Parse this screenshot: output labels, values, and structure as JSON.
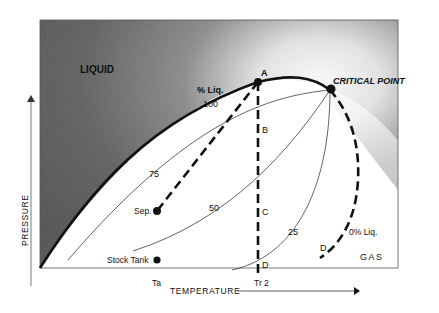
{
  "diagram": {
    "regions": {
      "liquid": "LIQUID",
      "gas": "GAS"
    },
    "critical_point": "CRITICAL POINT",
    "points": {
      "A": "A",
      "B": "B",
      "C": "C",
      "D_tr2": "D",
      "D_dew": "D",
      "separator": "Sep.",
      "stock_tank": "Stock Tank"
    },
    "quality_lines": {
      "header": "% Liq.",
      "q100": "100",
      "q75": "75",
      "q50": "50",
      "q25": "25",
      "q0": "0% Liq."
    },
    "axes": {
      "x_label": "TEMPERATURE",
      "y_label": "PRESSURE",
      "x_ticks": [
        "Ta",
        "Tr 2"
      ]
    }
  }
}
